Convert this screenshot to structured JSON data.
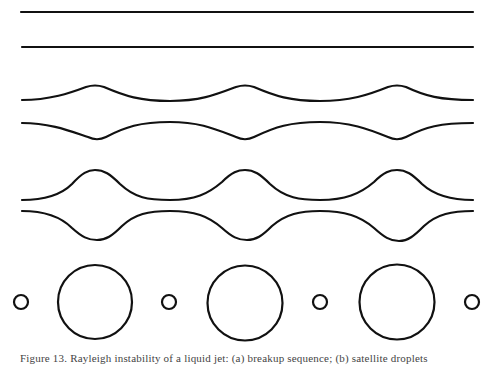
{
  "figure": {
    "stroke_color": "#111111",
    "background": "#ffffff",
    "panels": [
      {
        "name": "straight-jet",
        "description": "two parallel straight lines",
        "lines_y": [
          12,
          47
        ],
        "x_start": 21,
        "x_end": 473
      },
      {
        "name": "weak-perturbation",
        "description": "mirrored wavy boundaries with small-amplitude bulges",
        "upper_base_y": 100,
        "upper_peak_y": 85,
        "lower_base_y": 123,
        "lower_dip_y": 139,
        "bulge_x": [
          95,
          245,
          397
        ]
      },
      {
        "name": "strong-perturbation",
        "description": "mirrored wavy boundaries with larger-amplitude bulges",
        "upper_base_y": 200,
        "upper_peak_y": 170,
        "lower_base_y": 211,
        "lower_dip_y": 240,
        "bulge_x": [
          95,
          245,
          397
        ]
      },
      {
        "name": "droplets",
        "description": "alternating satellite and main droplets",
        "center_y": 302,
        "droplets": [
          {
            "x": 21,
            "r": 7,
            "kind": "satellite"
          },
          {
            "x": 95,
            "r": 37,
            "kind": "main"
          },
          {
            "x": 169,
            "r": 7,
            "kind": "satellite"
          },
          {
            "x": 245,
            "r": 37,
            "kind": "main"
          },
          {
            "x": 320,
            "r": 7,
            "kind": "satellite"
          },
          {
            "x": 397,
            "r": 37,
            "kind": "main"
          },
          {
            "x": 472,
            "r": 7,
            "kind": "satellite"
          }
        ]
      }
    ],
    "caption": "Figure 13. Rayleigh instability of a liquid jet: (a) breakup sequence; (b) satellite droplets"
  }
}
